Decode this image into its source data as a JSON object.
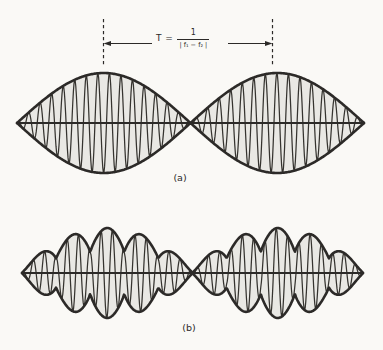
{
  "figure": {
    "width": 383,
    "height": 350,
    "background": "#faf9f6",
    "ink_color": "#2c2a28",
    "carrier_color": "#35332f",
    "fill_color": "#e9e8e4"
  },
  "annotation": {
    "formula": {
      "lhs": "T =",
      "numerator": "1",
      "denominator": "| f₁ − f₂ |"
    },
    "left_marker_x": 103.5,
    "right_marker_x": 272.5,
    "marker_top_y": 19,
    "marker_bottom_y": 65,
    "arrow_y": 43.5,
    "arrow_left_inner_x": 152,
    "arrow_right_inner_x": 228
  },
  "waveforms": [
    {
      "id": "a",
      "label": "(a)",
      "type": "beats-pure-tones",
      "x_start": 17,
      "x_end": 364,
      "axis_y": 123,
      "amplitude": 50,
      "lobes": 2,
      "carrier_period_px": 11.55,
      "envelope": {
        "shape": "sine",
        "power": 1,
        "ripple_count": 0,
        "ripple_floor": 1,
        "ripple_power": 1
      }
    },
    {
      "id": "b",
      "label": "(b)",
      "type": "beats-complex-tones",
      "x_start": 22,
      "x_end": 363,
      "axis_y": 273,
      "amplitude": 45,
      "lobes": 2,
      "carrier_period_px": 11.3,
      "envelope": {
        "shape": "rippled",
        "power": 0.75,
        "ripple_count": 5,
        "ripple_floor": 0.47,
        "ripple_power": 0.8
      }
    }
  ]
}
